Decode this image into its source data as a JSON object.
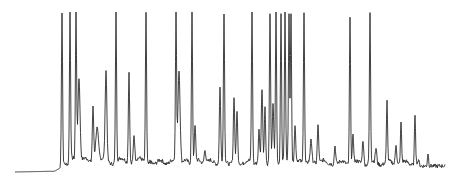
{
  "chart_data": {
    "type": "line",
    "title": "",
    "xlabel": "",
    "ylabel": "",
    "grid": false,
    "legend": null,
    "baseline_y_px": 172,
    "xlim_px": [
      15,
      445
    ],
    "ylim_px": [
      14,
      172
    ],
    "line_color": "#2a2a2a",
    "series": [
      {
        "name": "chromatogram",
        "peaks": [
          {
            "x": 62,
            "top": 14,
            "w": 0.8
          },
          {
            "x": 70,
            "top": 14,
            "w": 0.8
          },
          {
            "x": 76,
            "top": 14,
            "w": 0.8
          },
          {
            "x": 79,
            "top": 80,
            "w": 1.5
          },
          {
            "x": 93,
            "top": 110,
            "w": 1
          },
          {
            "x": 97,
            "top": 130,
            "w": 2
          },
          {
            "x": 106,
            "top": 72,
            "w": 1.2
          },
          {
            "x": 116,
            "top": 14,
            "w": 0.8
          },
          {
            "x": 129,
            "top": 74,
            "w": 0.9
          },
          {
            "x": 134,
            "top": 137,
            "w": 1
          },
          {
            "x": 146,
            "top": 14,
            "w": 0.8
          },
          {
            "x": 176,
            "top": 14,
            "w": 0.8
          },
          {
            "x": 179,
            "top": 72,
            "w": 1.5
          },
          {
            "x": 192,
            "top": 14,
            "w": 0.8
          },
          {
            "x": 195,
            "top": 128,
            "w": 1
          },
          {
            "x": 205,
            "top": 152,
            "w": 1.2
          },
          {
            "x": 220,
            "top": 88,
            "w": 0.9
          },
          {
            "x": 224,
            "top": 14,
            "w": 0.8
          },
          {
            "x": 234,
            "top": 98,
            "w": 0.9
          },
          {
            "x": 237,
            "top": 112,
            "w": 0.9
          },
          {
            "x": 252,
            "top": 14,
            "w": 0.8
          },
          {
            "x": 259,
            "top": 132,
            "w": 0.9
          },
          {
            "x": 262,
            "top": 90,
            "w": 1
          },
          {
            "x": 265,
            "top": 108,
            "w": 0.9
          },
          {
            "x": 270,
            "top": 14,
            "w": 0.8
          },
          {
            "x": 273,
            "top": 105,
            "w": 1
          },
          {
            "x": 276,
            "top": 14,
            "w": 0.8
          },
          {
            "x": 281,
            "top": 14,
            "w": 0.8
          },
          {
            "x": 285,
            "top": 14,
            "w": 0.8
          },
          {
            "x": 289,
            "top": 14,
            "w": 0.8
          },
          {
            "x": 291,
            "top": 14,
            "w": 0.8
          },
          {
            "x": 295,
            "top": 128,
            "w": 1
          },
          {
            "x": 304,
            "top": 14,
            "w": 0.8
          },
          {
            "x": 311,
            "top": 140,
            "w": 1
          },
          {
            "x": 318,
            "top": 128,
            "w": 1
          },
          {
            "x": 335,
            "top": 148,
            "w": 1
          },
          {
            "x": 350,
            "top": 20,
            "w": 0.8
          },
          {
            "x": 353,
            "top": 138,
            "w": 1
          },
          {
            "x": 363,
            "top": 142,
            "w": 1
          },
          {
            "x": 370,
            "top": 14,
            "w": 0.8
          },
          {
            "x": 376,
            "top": 150,
            "w": 1
          },
          {
            "x": 387,
            "top": 103,
            "w": 0.8
          },
          {
            "x": 396,
            "top": 146,
            "w": 1
          },
          {
            "x": 401,
            "top": 124,
            "w": 0.8
          },
          {
            "x": 415,
            "top": 116,
            "w": 0.8
          },
          {
            "x": 428,
            "top": 155,
            "w": 0.8
          }
        ]
      }
    ]
  }
}
